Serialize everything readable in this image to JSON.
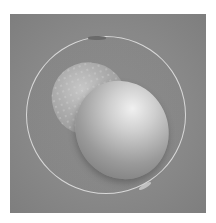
{
  "image": {
    "description": "Grayscale micrograph of a two-cell embryo inside a transparent zona pellucida",
    "colors": {
      "background": "#ffffff",
      "panel": "#888888",
      "zona_ring": "#d8d8d8",
      "cell_highlight": "#f0f0f0",
      "cell_shadow": "#6e6e6e"
    }
  }
}
